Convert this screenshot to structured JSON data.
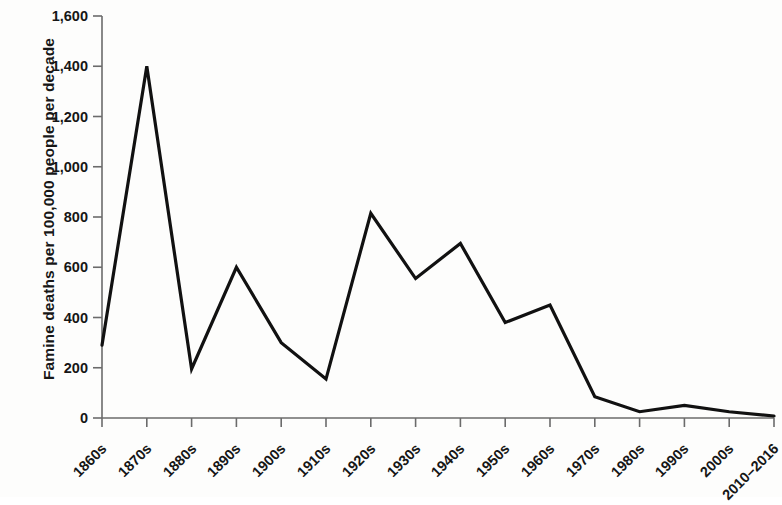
{
  "chart_data": {
    "type": "line",
    "title": "",
    "xlabel": "",
    "ylabel": "Famine deaths per 100,000 people per decade",
    "categories": [
      "1860s",
      "1870s",
      "1880s",
      "1890s",
      "1900s",
      "1910s",
      "1920s",
      "1930s",
      "1940s",
      "1950s",
      "1960s",
      "1970s",
      "1980s",
      "1990s",
      "2000s",
      "2010–2016"
    ],
    "values": [
      290,
      1400,
      195,
      600,
      300,
      155,
      815,
      555,
      695,
      380,
      450,
      85,
      25,
      50,
      25,
      8
    ],
    "ylim": [
      0,
      1600
    ],
    "y_ticks": [
      0,
      200,
      400,
      600,
      800,
      1000,
      1200,
      1400,
      1600
    ],
    "y_tick_labels": [
      "0",
      "200",
      "400",
      "600",
      "800",
      "1,000",
      "1,200",
      "1,400",
      "1,600"
    ],
    "grid": false,
    "legend": false,
    "series_color": "#111111",
    "line_width": 3.2
  }
}
